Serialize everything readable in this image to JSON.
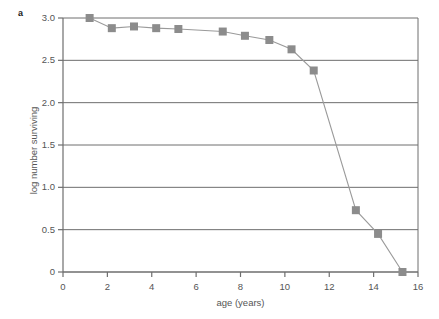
{
  "figure": {
    "panel_label": "a"
  },
  "chart_data": {
    "type": "line",
    "title": "",
    "xlabel": "age (years)",
    "ylabel": "log number surviving",
    "xlim": [
      0,
      16
    ],
    "ylim": [
      0,
      3.0
    ],
    "xticks": [
      0,
      2,
      4,
      6,
      8,
      10,
      12,
      14,
      16
    ],
    "xtick_labels": [
      "0",
      "2",
      "4",
      "6",
      "8",
      "10",
      "12",
      "14",
      "16"
    ],
    "yticks": [
      0,
      0.5,
      1.0,
      1.5,
      2.0,
      2.5,
      3.0
    ],
    "ytick_labels": [
      "0",
      "0.5",
      "1.0",
      "1.5",
      "2.0",
      "2.5",
      "3.0"
    ],
    "grid": "horizontal",
    "legend": "none",
    "marker": "square",
    "marker_color": "#8c8c8c",
    "line_color": "#9a9a9a",
    "axis_color": "#6e6e6e",
    "series": [
      {
        "name": "survivorship",
        "x": [
          1.2,
          2.2,
          3.2,
          4.2,
          5.2,
          7.2,
          8.2,
          9.3,
          10.3,
          11.3,
          13.2,
          14.2,
          15.3
        ],
        "values": [
          3.0,
          2.88,
          2.9,
          2.88,
          2.87,
          2.84,
          2.79,
          2.74,
          2.63,
          2.38,
          0.73,
          0.45,
          0.0
        ]
      }
    ]
  }
}
